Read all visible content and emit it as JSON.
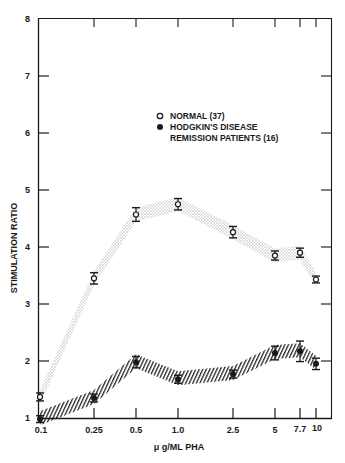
{
  "chart_data": {
    "type": "line",
    "title": "",
    "xlabel": "μ g/ML PHA",
    "ylabel": "STIMULATION RATIO",
    "x_scale": "log",
    "categories": [
      "0.1",
      "0.25",
      "0.5",
      "1.0",
      "2.5",
      "5",
      "7.7",
      "10"
    ],
    "x": [
      0.1,
      0.25,
      0.5,
      1.0,
      2.5,
      5,
      7.7,
      10
    ],
    "ylim": [
      1,
      8
    ],
    "yticks": [
      1,
      2,
      3,
      4,
      5,
      6,
      7,
      8
    ],
    "grid": false,
    "legend_position": "upper center",
    "series": [
      {
        "name": "NORMAL (37)",
        "marker": "open-circle",
        "band": "stippled",
        "values": [
          1.37,
          3.45,
          4.57,
          4.75,
          4.26,
          3.85,
          3.9,
          3.43
        ],
        "error": [
          0.07,
          0.1,
          0.12,
          0.1,
          0.1,
          0.08,
          0.08,
          0.06
        ]
      },
      {
        "name": "HODGKIN'S DISEASE REMISSION PATIENTS (16)",
        "marker": "filled-circle",
        "band": "hatched",
        "values": [
          0.98,
          1.35,
          1.98,
          1.68,
          1.77,
          2.14,
          2.17,
          1.95
        ],
        "error": [
          0.06,
          0.07,
          0.1,
          0.07,
          0.07,
          0.12,
          0.18,
          0.1
        ]
      }
    ]
  },
  "axes": {
    "y_tick_labels": [
      "1",
      "2",
      "3",
      "4",
      "5",
      "6",
      "7",
      "8"
    ],
    "x_tick_labels": [
      "0.1",
      "0.25",
      "0.5",
      "1.0",
      "2.5",
      "5",
      "7.7",
      "10"
    ],
    "x_title": "μ g/ML PHA",
    "y_title": "STIMULATION RATIO"
  },
  "legend": {
    "items": [
      {
        "label": "NORMAL (37)",
        "marker": "open-circle"
      },
      {
        "label_line1": "HODGKIN'S DISEASE",
        "label_line2": "REMISSION PATIENTS (16)",
        "marker": "filled-circle"
      }
    ]
  },
  "colors": {
    "ink": "#1a1a1a",
    "stipple": "#b8b8b8",
    "hatch": "#2a2a2a",
    "background": "#ffffff"
  }
}
